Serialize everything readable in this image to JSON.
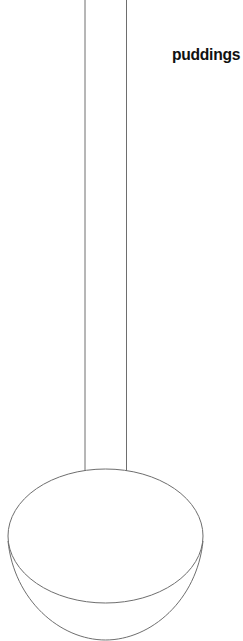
{
  "diagram": {
    "label": "puddings",
    "colors": {
      "stroke": "#6e6e6e",
      "text": "#111111",
      "background": "#ffffff"
    }
  }
}
